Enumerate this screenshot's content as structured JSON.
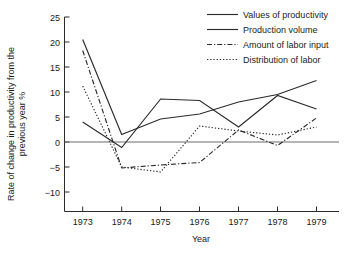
{
  "chart_data": {
    "type": "line",
    "title": "",
    "xlabel": "Year",
    "ylabel": "Rate of change in productivity from the previous year %",
    "categories": [
      "1973",
      "1974",
      "1975",
      "1976",
      "1977",
      "1978",
      "1979"
    ],
    "x": [
      1973,
      1974,
      1975,
      1976,
      1977,
      1978,
      1979
    ],
    "xlim": [
      1972.6,
      1979.4
    ],
    "ylim": [
      -12.5,
      25
    ],
    "yticks": [
      -10,
      -5,
      0,
      5,
      10,
      15,
      20,
      25
    ],
    "ytick_labels": [
      "−10",
      "−5",
      "0",
      "5",
      "10",
      "15",
      "20",
      "25"
    ],
    "grid": false,
    "zero_line": 0,
    "legend_position": "top-right",
    "series": [
      {
        "name": "Values of productivity",
        "style": "solid",
        "values": [
          20.5,
          1.5,
          4.6,
          5.6,
          8.0,
          9.5,
          12.3
        ]
      },
      {
        "name": "Production volume",
        "style": "solid",
        "values": [
          4.0,
          -1.1,
          8.6,
          8.3,
          3.0,
          9.3,
          6.6
        ]
      },
      {
        "name": "Amount of labor input",
        "style": "dash-dot",
        "values": [
          18.3,
          -5.2,
          -4.6,
          -4.1,
          2.4,
          -0.7,
          4.8
        ]
      },
      {
        "name": "Distribution of labor",
        "style": "dotted",
        "values": [
          11.2,
          -5.0,
          -6.0,
          3.2,
          2.2,
          1.4,
          3.0
        ]
      }
    ]
  },
  "legend": {
    "items": [
      {
        "label": "Values of productivity",
        "style": "solid"
      },
      {
        "label": "Production volume",
        "style": "solid"
      },
      {
        "label": "Amount of labor input",
        "style": "dash-dot"
      },
      {
        "label": "Distribution of labor",
        "style": "dotted"
      }
    ]
  },
  "axes": {
    "x_title": "Year",
    "y_title_line1": "Rate of change in productivity from the",
    "y_title_line2": "previous year %"
  }
}
